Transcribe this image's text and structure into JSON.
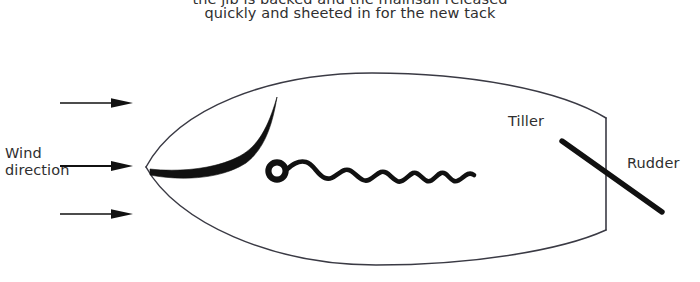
{
  "diagram": {
    "title_caption": {
      "line_cutoff": "the jib is backed and the mainsail released",
      "line_visible": "quickly and sheeted in for the new tack"
    },
    "labels": {
      "wind_direction": "Wind\ndirection",
      "tiller": "Tiller",
      "rudder": "Rudder"
    },
    "colors": {
      "ink": "#111111",
      "hull_outline": "#3a3a44",
      "text": "#2f2f2f",
      "background": "#ffffff"
    },
    "parts": {
      "hull": "boat-hull-outline",
      "transom": "transom-line",
      "jib": "backed-jib-sail",
      "mast": "mast-circle",
      "mainsail": "luffing-mainsail-wavy-line",
      "tiller_rudder": "tiller-rudder-bar",
      "wind_arrows": [
        "wind-arrow-top",
        "wind-arrow-middle",
        "wind-arrow-bottom"
      ]
    },
    "wind_arrows": [
      {
        "name": "wind-arrow-top",
        "y": 103,
        "x_start": 60,
        "x_end": 131
      },
      {
        "name": "wind-arrow-middle",
        "y": 166,
        "x_start": 60,
        "x_end": 131
      },
      {
        "name": "wind-arrow-bottom",
        "y": 214,
        "x_start": 60,
        "x_end": 131
      }
    ]
  }
}
